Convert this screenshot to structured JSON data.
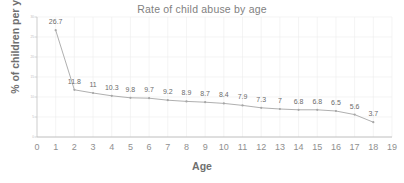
{
  "chart_data": {
    "type": "line",
    "title": "Rate of child abuse by age",
    "xlabel": "Age",
    "ylabel": "% of children per year",
    "x": [
      1,
      2,
      3,
      4,
      5,
      6,
      7,
      8,
      9,
      10,
      11,
      12,
      13,
      14,
      15,
      16,
      17,
      18
    ],
    "values": [
      26.7,
      11.8,
      11,
      10.3,
      9.8,
      9.7,
      9.2,
      8.9,
      8.7,
      8.4,
      7.9,
      7.3,
      7,
      6.8,
      6.8,
      6.5,
      5.6,
      3.7
    ],
    "point_labels": [
      "26.7",
      "11.8",
      "11",
      "10.3",
      "9.8",
      "9.7",
      "9.2",
      "8.9",
      "8.7",
      "8.4",
      "7.9",
      "7.3",
      "7",
      "6.8",
      "6.8",
      "6.5",
      "5.6",
      "3.7"
    ],
    "xlim": [
      0,
      19
    ],
    "ylim": [
      0,
      30
    ],
    "x_tick_labels": [
      "0",
      "1",
      "2",
      "3",
      "4",
      "5",
      "6",
      "7",
      "8",
      "9",
      "10",
      "11",
      "12",
      "13",
      "14",
      "15",
      "16",
      "17",
      "18",
      "19"
    ],
    "y_tick_labels": [
      "30",
      "25",
      "20",
      "15",
      "10",
      "5",
      "0"
    ],
    "grid": true,
    "legend": "none",
    "series_color": "#a6a6a6",
    "marker": "circle"
  }
}
